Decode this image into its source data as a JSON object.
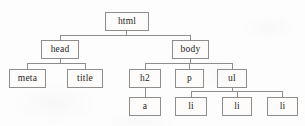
{
  "diagram": {
    "type": "tree",
    "colors": {
      "background": "#fdfdfd",
      "node_fill": "#fdfcfa",
      "node_border": "#8d8d8d",
      "edge": "#8d8d8d",
      "text": "#1e1e1e"
    },
    "nodes": [
      {
        "id": "html",
        "label": "html",
        "x": 105,
        "y": 12,
        "w": 44,
        "h": 19,
        "level": 0
      },
      {
        "id": "head",
        "label": "head",
        "x": 41,
        "y": 40,
        "w": 38,
        "h": 19,
        "level": 1
      },
      {
        "id": "body",
        "label": "body",
        "x": 172,
        "y": 40,
        "w": 37,
        "h": 19,
        "level": 1
      },
      {
        "id": "meta",
        "label": "meta",
        "x": 9,
        "y": 69,
        "w": 37,
        "h": 19,
        "level": 2
      },
      {
        "id": "title",
        "label": "title",
        "x": 67,
        "y": 69,
        "w": 36,
        "h": 19,
        "level": 2
      },
      {
        "id": "h2",
        "label": "h2",
        "x": 129,
        "y": 69,
        "w": 32,
        "h": 19,
        "level": 2
      },
      {
        "id": "p",
        "label": "p",
        "x": 175,
        "y": 69,
        "w": 29,
        "h": 19,
        "level": 2
      },
      {
        "id": "ul",
        "label": "ul",
        "x": 217,
        "y": 69,
        "w": 30,
        "h": 19,
        "level": 2
      },
      {
        "id": "a",
        "label": "a",
        "x": 129,
        "y": 97,
        "w": 32,
        "h": 19,
        "level": 3
      },
      {
        "id": "li1",
        "label": "li",
        "x": 175,
        "y": 97,
        "w": 32,
        "h": 19,
        "level": 3
      },
      {
        "id": "li2",
        "label": "li",
        "x": 222,
        "y": 97,
        "w": 30,
        "h": 19,
        "level": 3
      },
      {
        "id": "li3",
        "label": "li",
        "x": 267,
        "y": 97,
        "w": 31,
        "h": 19,
        "level": 3
      }
    ],
    "edges": [
      {
        "from": "html",
        "to": "head"
      },
      {
        "from": "html",
        "to": "body"
      },
      {
        "from": "head",
        "to": "meta"
      },
      {
        "from": "head",
        "to": "title"
      },
      {
        "from": "body",
        "to": "h2"
      },
      {
        "from": "body",
        "to": "p"
      },
      {
        "from": "body",
        "to": "ul"
      },
      {
        "from": "h2",
        "to": "a"
      },
      {
        "from": "ul",
        "to": "li1"
      },
      {
        "from": "ul",
        "to": "li2"
      },
      {
        "from": "ul",
        "to": "li3"
      }
    ]
  }
}
